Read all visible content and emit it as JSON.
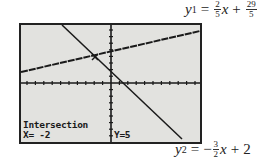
{
  "equations": {
    "y1": {
      "var": "y",
      "sub": "1",
      "eq": "=",
      "slope_num": "2",
      "slope_den": "5",
      "x": "x",
      "plus": "+",
      "int_num": "29",
      "int_den": "5"
    },
    "y2": {
      "var": "y",
      "sub": "2",
      "eq": "=",
      "sign": "−",
      "slope_num": "3",
      "slope_den": "2",
      "x": "x",
      "plus": "+",
      "intercept": "2"
    }
  },
  "screen": {
    "title": "Intersection",
    "x_readout": "X= -2",
    "y_readout": "Y=5",
    "background": "#e2e2df",
    "line_color": "#1a1a1a"
  },
  "graph": {
    "lines": [
      {
        "name": "y1",
        "slope": 0.4,
        "intercept": 5.8
      },
      {
        "name": "y2",
        "slope": -1.5,
        "intercept": 2
      }
    ],
    "intersection": {
      "x": -2,
      "y": 5
    }
  }
}
